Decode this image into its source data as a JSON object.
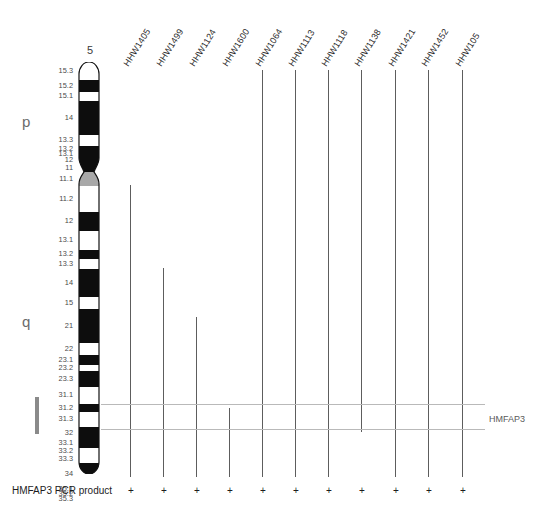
{
  "figure": {
    "chromosome_number": "5",
    "arm_labels": {
      "p": "p",
      "q": "q"
    },
    "gene_label": "HMFAP3",
    "pcr_row_label": "HMFAP3 PCR product"
  },
  "chart_data": {
    "type": "diagram",
    "chromosome": "5",
    "band_labels_p": [
      "15.3",
      "15.2",
      "15.1",
      "14",
      "13.3",
      "13.2",
      "13.1",
      "12",
      "11",
      "11.1"
    ],
    "band_labels_q": [
      "11.2",
      "12",
      "13.1",
      "13.2",
      "13.3",
      "14",
      "15",
      "21",
      "22",
      "23.1",
      "23.2",
      "23.3",
      "31.1",
      "31.2",
      "31.3",
      "32",
      "33.1",
      "33.2",
      "33.3",
      "34",
      "35.1",
      "35.2",
      "35.3"
    ],
    "markers": [
      "HHW1405",
      "HHW1499",
      "HHW1124",
      "HHW1600",
      "HHW1064",
      "HHW1113",
      "HHW1118",
      "HHW1138",
      "HHW1421",
      "HHW1452",
      "HHW105"
    ],
    "pcr_results": [
      "+",
      "+",
      "+",
      "+",
      "+",
      "+",
      "+",
      "+",
      "+",
      "+",
      "+"
    ],
    "locus_region": "5q31.3-q33.2",
    "legend_position": "right"
  },
  "bands": [
    {
      "label": "15.3",
      "y": 72,
      "top": 62,
      "h": 18,
      "stain": "white"
    },
    {
      "label": "15.2",
      "y": 92,
      "top": 80,
      "h": 12,
      "stain": "black"
    },
    {
      "label": "15.1",
      "y": 101,
      "top": 92,
      "h": 9,
      "stain": "white"
    },
    {
      "label": "14",
      "y": 118,
      "top": 101,
      "h": 34,
      "stain": "black"
    },
    {
      "label": "13.3",
      "y": 141,
      "top": 135,
      "h": 11,
      "stain": "white"
    },
    {
      "label": "13.2",
      "y": 150,
      "top": 146,
      "h": 6,
      "stain": "black"
    },
    {
      "label": "13.1",
      "y": 157,
      "top": 152,
      "h": 5,
      "stain": "black"
    },
    {
      "label": "12",
      "y": 164,
      "top": 157,
      "h": 7,
      "stain": "black"
    },
    {
      "label": "11",
      "y": 172,
      "top": 164,
      "h": 8,
      "stain": "black"
    },
    {
      "label": "11.1",
      "y": 181,
      "top": 172,
      "h": 14,
      "stain": "grey"
    },
    {
      "label": "11.2",
      "y": 201,
      "top": 186,
      "h": 26,
      "stain": "white"
    },
    {
      "label": "12",
      "y": 228,
      "top": 212,
      "h": 19,
      "stain": "black"
    },
    {
      "label": "13.1",
      "y": 249,
      "top": 231,
      "h": 19,
      "stain": "white"
    },
    {
      "label": "13.2",
      "y": 267,
      "top": 250,
      "h": 9,
      "stain": "black"
    },
    {
      "label": "13.3",
      "y": 275,
      "top": 259,
      "h": 10,
      "stain": "white"
    },
    {
      "label": "14",
      "y": 294,
      "top": 269,
      "h": 28,
      "stain": "black"
    },
    {
      "label": "15",
      "y": 319,
      "top": 297,
      "h": 12,
      "stain": "white"
    },
    {
      "label": "21",
      "y": 341,
      "top": 309,
      "h": 34,
      "stain": "black"
    },
    {
      "label": "22",
      "y": 367,
      "top": 343,
      "h": 12,
      "stain": "white"
    },
    {
      "label": "23.1",
      "y": 379,
      "top": 355,
      "h": 10,
      "stain": "black"
    },
    {
      "label": "23.2",
      "y": 388,
      "top": 365,
      "h": 6,
      "stain": "white"
    },
    {
      "label": "23.3",
      "y": 397,
      "top": 371,
      "h": 16,
      "stain": "black"
    },
    {
      "label": "31.1",
      "y": 418,
      "top": 387,
      "h": 17,
      "stain": "white"
    },
    {
      "label": "31.2",
      "y": 432,
      "top": 404,
      "h": 8,
      "stain": "black"
    },
    {
      "label": "31.3",
      "y": 442,
      "top": 412,
      "h": 15,
      "stain": "white"
    },
    {
      "label": "32",
      "y": 457,
      "top": 427,
      "h": 12,
      "stain": "black"
    },
    {
      "label": "33.1",
      "y": 464,
      "top": 439,
      "h": 9,
      "stain": "black"
    },
    {
      "label": "33.2",
      "y": 474,
      "top": 448,
      "h": 7,
      "stain": "white"
    },
    {
      "label": "33.3",
      "y": 482,
      "top": 455,
      "h": 8,
      "stain": "white"
    },
    {
      "label": "34",
      "y": 497,
      "top": 463,
      "h": 23,
      "stain": "black"
    },
    {
      "label": "35.1",
      "y": 508,
      "top": 486,
      "h": 6,
      "stain": "black"
    },
    {
      "label": "35.2",
      "y": 515,
      "top": 492,
      "h": 4,
      "stain": "white"
    },
    {
      "label": "35.3",
      "y": 521,
      "top": 496,
      "h": 6,
      "stain": "white"
    }
  ],
  "markers": [
    {
      "name": "HHW1405",
      "x": 130,
      "top": 185,
      "bottom": 477,
      "pcr": "+"
    },
    {
      "name": "HHW1499",
      "x": 163,
      "top": 268,
      "bottom": 477,
      "pcr": "+"
    },
    {
      "name": "HHW1124",
      "x": 196,
      "top": 317,
      "bottom": 477,
      "pcr": "+"
    },
    {
      "name": "HHW1600",
      "x": 229,
      "top": 408,
      "bottom": 477,
      "pcr": "+"
    },
    {
      "name": "HHW1064",
      "x": 262,
      "top": 70,
      "bottom": 477,
      "pcr": "+"
    },
    {
      "name": "HHW1113",
      "x": 295,
      "top": 70,
      "bottom": 477,
      "pcr": "+"
    },
    {
      "name": "HHW1118",
      "x": 328,
      "top": 70,
      "bottom": 477,
      "pcr": "+"
    },
    {
      "name": "HHW1138",
      "x": 361,
      "top": 70,
      "bottom": 432,
      "pcr": "+"
    },
    {
      "name": "HHW1421",
      "x": 395,
      "top": 70,
      "bottom": 477,
      "pcr": "+"
    },
    {
      "name": "HHW1452",
      "x": 428,
      "top": 70,
      "bottom": 477,
      "pcr": "+"
    },
    {
      "name": "HHW105",
      "x": 462,
      "top": 70,
      "bottom": 477,
      "pcr": "+"
    }
  ],
  "annotation_lines": [
    {
      "y": 404,
      "x1": 101,
      "x2": 485
    },
    {
      "y": 429,
      "x1": 101,
      "x2": 485
    }
  ],
  "colors": {
    "band_dark": "#0d0d0d",
    "band_light": "#ffffff",
    "centromere": "#a8a8a8",
    "outline": "#111111",
    "marker_line": "#5d5d5d",
    "annotation_line": "#b9b9b9",
    "text": "#1d1d1d"
  }
}
